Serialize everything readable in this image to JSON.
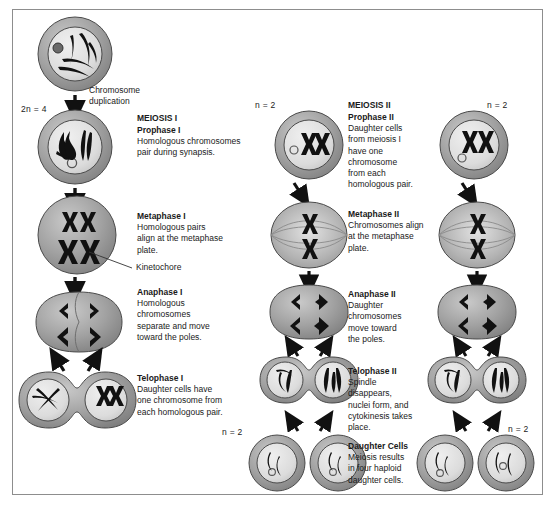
{
  "figure": {
    "border_color": "#8d8d8d",
    "background": "#ffffff",
    "cell_fill": "#9a9a9a",
    "nucleus_fill": "#d8d8d8",
    "chromosome_color": "#111111"
  },
  "annotations": {
    "chromosome_duplication": "Chromosome\nduplication",
    "kinetochore": "Kinetochore",
    "diploid_label": "2n = 4",
    "haploid_label": "n = 2"
  },
  "columns": {
    "meiosis_one_header": "MEIOSIS I",
    "meiosis_two_header": "MEIOSIS II"
  },
  "stages": [
    {
      "id": "prophase-1",
      "name": "Prophase I",
      "description": "Homologous chromosomes\npair during synapsis."
    },
    {
      "id": "metaphase-1",
      "name": "Metaphase I",
      "description": "Homologous pairs\nalign at the metaphase\nplate."
    },
    {
      "id": "anaphase-1",
      "name": "Anaphase I",
      "description": "Homologous\nchromosomes\nseparate and move\ntoward the poles."
    },
    {
      "id": "telophase-1",
      "name": "Telophase I",
      "description": "Daughter cells have\none chromosome from\neach homologous pair."
    },
    {
      "id": "prophase-2",
      "name": "Prophase II",
      "description": "Daughter cells\nfrom meiosis I\nhave one\nchromosome\nfrom each\nhomologous pair."
    },
    {
      "id": "metaphase-2",
      "name": "Metaphase II",
      "description": "Chromosomes align\nat the metaphase\nplate."
    },
    {
      "id": "anaphase-2",
      "name": "Anaphase II",
      "description": "Daughter\nchromosomes\nmove toward\nthe poles."
    },
    {
      "id": "telophase-2",
      "name": "Telophase II",
      "description": "Spindle\ndisappears,\nnuclei form, and\ncytokinesis takes\nplace."
    },
    {
      "id": "daughter-cells",
      "name": "Daughter Cells",
      "description": "Meiosis results\nin four haploid\ndaughter cells."
    }
  ],
  "ploidy_markers": [
    {
      "id": "parent-2n",
      "text": "2n = 4",
      "x": 21,
      "y": 104
    },
    {
      "id": "mid-top-n",
      "text": "n = 2",
      "x": 255,
      "y": 100
    },
    {
      "id": "right-top-n",
      "text": "n = 2",
      "x": 487,
      "y": 100
    },
    {
      "id": "mid-bottom-n",
      "text": "n = 2",
      "x": 222,
      "y": 427
    },
    {
      "id": "right-bottom-n",
      "text": "n = 2",
      "x": 508,
      "y": 424
    }
  ],
  "captions": [
    {
      "stage": 0,
      "x": 137,
      "y": 113
    },
    {
      "stage": 1,
      "x": 137,
      "y": 211
    },
    {
      "stage": 2,
      "x": 137,
      "y": 287
    },
    {
      "stage": 3,
      "x": 137,
      "y": 373
    },
    {
      "stage": 4,
      "x": 348,
      "y": 122
    },
    {
      "stage": 5,
      "x": 348,
      "y": 209
    },
    {
      "stage": 6,
      "x": 348,
      "y": 289
    },
    {
      "stage": 7,
      "x": 348,
      "y": 366
    },
    {
      "stage": 8,
      "x": 348,
      "y": 441
    }
  ]
}
